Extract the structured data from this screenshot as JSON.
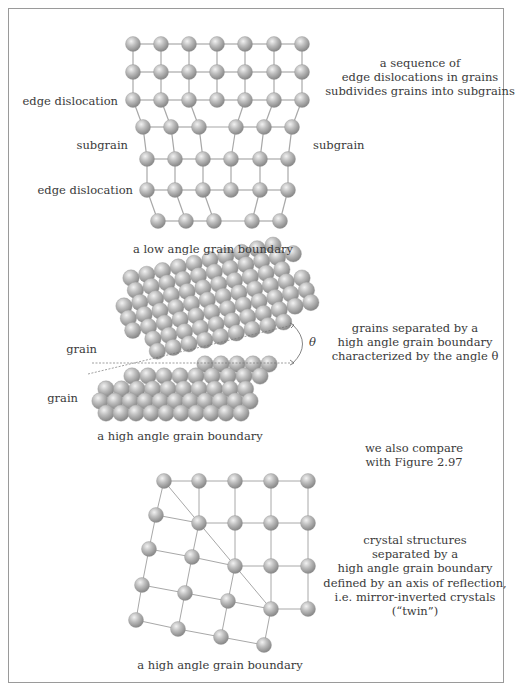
{
  "figure": {
    "panels": [
      {
        "id": "low-angle",
        "caption": "a low angle grain boundary",
        "description_lines": [
          "a sequence of",
          "edge dislocations in grains",
          "subdivides grains into subgrains"
        ],
        "labels": {
          "edge_dislocation_top": "edge dislocation",
          "subgrain_left": "subgrain",
          "subgrain_right": "subgrain",
          "edge_dislocation_bottom": "edge dislocation"
        }
      },
      {
        "id": "high-angle",
        "caption": "a high angle grain boundary",
        "description_lines": [
          "grains separated by a",
          "high angle grain boundary",
          "characterized by the angle θ"
        ],
        "labels": {
          "grain_top": "grain",
          "grain_bottom": "grain",
          "angle": "θ"
        },
        "note_lines": [
          "we also compare",
          "with Figure 2.97"
        ]
      },
      {
        "id": "twin",
        "caption": "a high angle grain boundary",
        "description_lines": [
          "crystal structures",
          "separated by a",
          "high angle grain boundary",
          "defined by an axis of reflection,",
          "i.e. mirror-inverted crystals",
          "(“twin”)"
        ]
      }
    ],
    "colors": {
      "atom_light": "#e6e6e6",
      "atom_mid": "#b4b4b4",
      "atom_dark": "#8a8a8a",
      "bond": "#a8a8a8",
      "border": "#9a9a9a",
      "text": "#3a3a3a"
    },
    "lattice_low": {
      "rows": [
        [
          [
            133,
            44
          ],
          [
            161,
            44
          ],
          [
            189,
            44
          ],
          [
            217,
            44
          ],
          [
            245,
            44
          ],
          [
            274,
            44
          ],
          [
            302,
            44
          ]
        ],
        [
          [
            133,
            72
          ],
          [
            161,
            72
          ],
          [
            189,
            72
          ],
          [
            217,
            72
          ],
          [
            245,
            72
          ],
          [
            274,
            72
          ],
          [
            302,
            72
          ]
        ],
        [
          [
            133,
            100
          ],
          [
            161,
            100
          ],
          [
            189,
            100
          ],
          [
            217,
            100
          ],
          [
            245,
            100
          ],
          [
            274,
            100
          ],
          [
            302,
            100
          ]
        ],
        [
          [
            143,
            127
          ],
          [
            171,
            127
          ],
          [
            199,
            127
          ],
          [
            236,
            127
          ],
          [
            264,
            127
          ],
          [
            292,
            127
          ]
        ],
        [
          [
            147,
            159
          ],
          [
            175,
            159
          ],
          [
            203,
            159
          ],
          [
            231,
            159
          ],
          [
            260,
            159
          ],
          [
            288,
            159
          ]
        ],
        [
          [
            147,
            190
          ],
          [
            175,
            190
          ],
          [
            203,
            190
          ],
          [
            231,
            190
          ],
          [
            260,
            190
          ],
          [
            288,
            190
          ]
        ],
        [
          [
            158,
            221
          ],
          [
            186,
            221
          ],
          [
            214,
            221
          ],
          [
            252,
            221
          ],
          [
            280,
            221
          ]
        ]
      ],
      "vbonds": [
        [
          [
            0,
            0
          ],
          [
            1,
            0
          ]
        ],
        [
          [
            0,
            1
          ],
          [
            1,
            1
          ]
        ],
        [
          [
            0,
            2
          ],
          [
            1,
            2
          ]
        ],
        [
          [
            0,
            3
          ],
          [
            1,
            3
          ]
        ],
        [
          [
            0,
            4
          ],
          [
            1,
            4
          ]
        ],
        [
          [
            0,
            5
          ],
          [
            1,
            5
          ]
        ],
        [
          [
            0,
            6
          ],
          [
            1,
            6
          ]
        ],
        [
          [
            1,
            0
          ],
          [
            2,
            0
          ]
        ],
        [
          [
            1,
            1
          ],
          [
            2,
            1
          ]
        ],
        [
          [
            1,
            2
          ],
          [
            2,
            2
          ]
        ],
        [
          [
            1,
            3
          ],
          [
            2,
            3
          ]
        ],
        [
          [
            1,
            4
          ],
          [
            2,
            4
          ]
        ],
        [
          [
            1,
            5
          ],
          [
            2,
            5
          ]
        ],
        [
          [
            1,
            6
          ],
          [
            2,
            6
          ]
        ],
        [
          [
            2,
            0
          ],
          [
            3,
            0
          ]
        ],
        [
          [
            2,
            1
          ],
          [
            3,
            1
          ]
        ],
        [
          [
            2,
            2
          ],
          [
            3,
            2
          ]
        ],
        [
          [
            2,
            4
          ],
          [
            3,
            3
          ]
        ],
        [
          [
            2,
            5
          ],
          [
            3,
            4
          ]
        ],
        [
          [
            2,
            6
          ],
          [
            3,
            5
          ]
        ],
        [
          [
            3,
            0
          ],
          [
            4,
            0
          ]
        ],
        [
          [
            3,
            1
          ],
          [
            4,
            1
          ]
        ],
        [
          [
            3,
            2
          ],
          [
            4,
            2
          ]
        ],
        [
          [
            3,
            3
          ],
          [
            4,
            3
          ]
        ],
        [
          [
            3,
            4
          ],
          [
            4,
            4
          ]
        ],
        [
          [
            3,
            5
          ],
          [
            4,
            5
          ]
        ],
        [
          [
            4,
            0
          ],
          [
            5,
            0
          ]
        ],
        [
          [
            4,
            1
          ],
          [
            5,
            1
          ]
        ],
        [
          [
            4,
            2
          ],
          [
            5,
            2
          ]
        ],
        [
          [
            4,
            3
          ],
          [
            5,
            3
          ]
        ],
        [
          [
            4,
            4
          ],
          [
            5,
            4
          ]
        ],
        [
          [
            4,
            5
          ],
          [
            5,
            5
          ]
        ],
        [
          [
            5,
            0
          ],
          [
            6,
            0
          ]
        ],
        [
          [
            5,
            1
          ],
          [
            6,
            1
          ]
        ],
        [
          [
            5,
            2
          ],
          [
            6,
            2
          ]
        ],
        [
          [
            5,
            4
          ],
          [
            6,
            3
          ]
        ],
        [
          [
            5,
            5
          ],
          [
            6,
            4
          ]
        ]
      ]
    },
    "lattice_twin": {
      "atoms": [
        [
          164,
          481
        ],
        [
          199,
          481
        ],
        [
          235,
          481
        ],
        [
          271,
          481
        ],
        [
          308,
          481
        ],
        [
          156,
          515
        ],
        [
          199,
          523
        ],
        [
          235,
          523
        ],
        [
          271,
          523
        ],
        [
          308,
          523
        ],
        [
          149,
          549
        ],
        [
          192,
          557
        ],
        [
          235,
          566
        ],
        [
          271,
          566
        ],
        [
          308,
          566
        ],
        [
          142,
          585
        ],
        [
          185,
          593
        ],
        [
          228,
          601
        ],
        [
          271,
          609
        ],
        [
          308,
          609
        ],
        [
          136,
          620
        ],
        [
          178,
          629
        ],
        [
          221,
          637
        ],
        [
          264,
          645
        ]
      ],
      "bonds": [
        [
          0,
          1
        ],
        [
          1,
          2
        ],
        [
          2,
          3
        ],
        [
          3,
          4
        ],
        [
          6,
          7
        ],
        [
          7,
          8
        ],
        [
          8,
          9
        ],
        [
          12,
          13
        ],
        [
          13,
          14
        ],
        [
          18,
          19
        ],
        [
          5,
          6
        ],
        [
          10,
          11
        ],
        [
          11,
          12
        ],
        [
          15,
          16
        ],
        [
          16,
          17
        ],
        [
          17,
          18
        ],
        [
          20,
          21
        ],
        [
          21,
          22
        ],
        [
          22,
          23
        ],
        [
          0,
          5
        ],
        [
          5,
          10
        ],
        [
          10,
          15
        ],
        [
          15,
          20
        ],
        [
          1,
          6
        ],
        [
          6,
          11
        ],
        [
          11,
          16
        ],
        [
          16,
          21
        ],
        [
          2,
          7
        ],
        [
          7,
          12
        ],
        [
          12,
          17
        ],
        [
          17,
          22
        ],
        [
          3,
          8
        ],
        [
          8,
          13
        ],
        [
          13,
          18
        ],
        [
          18,
          23
        ],
        [
          4,
          9
        ],
        [
          9,
          14
        ],
        [
          14,
          19
        ],
        [
          0,
          6
        ],
        [
          6,
          12
        ],
        [
          12,
          18
        ]
      ],
      "mirror_axis": [
        [
          164,
          481
        ],
        [
          271,
          609
        ]
      ]
    }
  }
}
